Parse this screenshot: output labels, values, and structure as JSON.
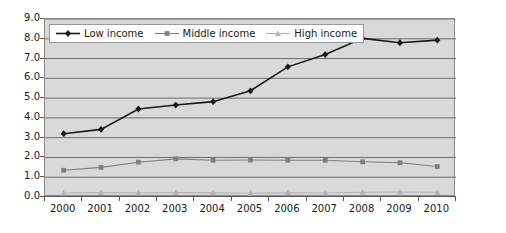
{
  "chart_data": {
    "type": "line",
    "title": "",
    "xlabel": "",
    "ylabel": "",
    "categories": [
      "2000",
      "2001",
      "2002",
      "2003",
      "2004",
      "2005",
      "2006",
      "2007",
      "2008",
      "2009",
      "2010"
    ],
    "ylim": [
      0.0,
      9.0
    ],
    "ytick_labels": [
      "0.0",
      "1.0",
      "2.0",
      "3.0",
      "4.0",
      "5.0",
      "6.0",
      "7.0",
      "8.0",
      "9.0"
    ],
    "yticks": [
      0.0,
      1.0,
      2.0,
      3.0,
      4.0,
      5.0,
      6.0,
      7.0,
      8.0,
      9.0
    ],
    "grid": "horizontal",
    "legend_position": "top-left",
    "series": [
      {
        "name": "Low income",
        "color": "#1a1a1a",
        "marker": "diamond",
        "values": [
          3.2,
          3.42,
          4.45,
          4.65,
          4.82,
          5.37,
          6.58,
          7.2,
          8.02,
          7.8,
          7.93
        ]
      },
      {
        "name": "Middle income",
        "color": "#808080",
        "marker": "square",
        "values": [
          1.35,
          1.5,
          1.76,
          1.93,
          1.86,
          1.87,
          1.86,
          1.86,
          1.78,
          1.73,
          1.54
        ]
      },
      {
        "name": "High income",
        "color": "#b3b3b3",
        "marker": "triangle",
        "values": [
          0.2,
          0.22,
          0.2,
          0.22,
          0.21,
          0.19,
          0.21,
          0.2,
          0.24,
          0.25,
          0.24
        ]
      }
    ]
  },
  "style": {
    "plot_background": "#d9d9d9",
    "page_background": "#ffffff",
    "gridline_color": "#6e6e6e",
    "axis_color": "#5a5a5a",
    "legend_background": "#ffffff",
    "legend_border": "#9a9a9a",
    "text_color": "#1a1a1a"
  }
}
